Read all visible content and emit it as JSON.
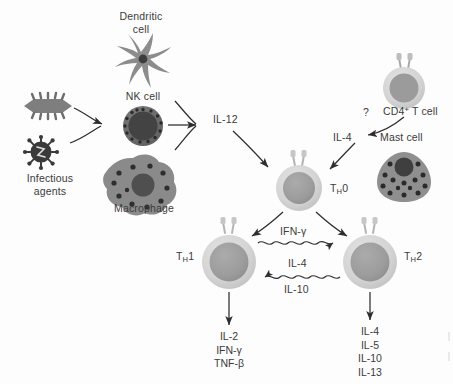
{
  "figure": {
    "background_color": "#fdfdfd",
    "text_color": "#3b3b3b"
  },
  "cells": {
    "dendritic": {
      "label_line1": "Dendritic",
      "label_line2": "cell",
      "color": "#8c8c8c"
    },
    "nk": {
      "label": "NK cell",
      "color": "#6e6e6e",
      "nucleus_color": "#4a4a4a"
    },
    "macrophage": {
      "label": "Macrophage",
      "color": "#8a8a8a",
      "nucleus_color": "#4f4f4f"
    },
    "cd4_t": {
      "label_main": "CD4",
      "label_sup": "+",
      "label_tail": " T cell",
      "ring_color": "#c9c9c9",
      "nucleus_color": "#9a9a9a"
    },
    "mast": {
      "label": "Mast cell",
      "color": "#8f8f8f",
      "nucleus_color": "#3f3f3f"
    },
    "th0": {
      "label_main": "T",
      "label_sub": "H",
      "label_tail": "0",
      "ring_color": "#d2d2d2",
      "nucleus_color": "#9c9c9c"
    },
    "th1": {
      "label_main": "T",
      "label_sub": "H",
      "label_tail": "1",
      "ring_color": "#d2d2d2",
      "nucleus_color": "#9c9c9c"
    },
    "th2": {
      "label_main": "T",
      "label_sub": "H",
      "label_tail": "2",
      "ring_color": "#d2d2d2",
      "nucleus_color": "#9c9c9c"
    }
  },
  "pathogens": {
    "label_line1": "Infectious",
    "label_line2": "agents",
    "bacterium_color": "#7e7e7e",
    "virus_color": "#3a3a3a"
  },
  "signals": {
    "il12": "IL-12",
    "il4_to_th0": "IL-4",
    "question_mark": "?",
    "ifn_gamma_cross": "IFN-γ",
    "il4_cross": "IL-4",
    "il10_cross": "IL-10"
  },
  "outputs": {
    "th1": [
      "IL-2",
      "IFN-γ",
      "TNF-β"
    ],
    "th2": [
      "IL-4",
      "IL-5",
      "IL-10",
      "IL-13"
    ]
  }
}
